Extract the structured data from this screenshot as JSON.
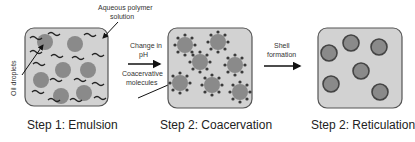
{
  "diagram": {
    "panels": [
      {
        "id": "emulsion",
        "caption": "Step 1: Emulsion"
      },
      {
        "id": "coacervation",
        "caption": "Step 2: Coacervation"
      },
      {
        "id": "reticulation",
        "caption": "Step 2: Reticulation"
      }
    ],
    "labels": {
      "aqueous_line1": "Aqueous polymer",
      "aqueous_line2": "solution",
      "oil_droplets": "Oil droplets",
      "change_line1": "Change in",
      "change_line2": "pH",
      "coacervative_line1": "Coacervative",
      "coacervative_line2": "molecules",
      "shell_line1": "Shell",
      "shell_line2": "formation"
    },
    "colors": {
      "panel_fill": "#d2d2d2",
      "panel_stroke": "#555555",
      "droplet": "#8a8a8a",
      "droplet_stroke": "#444444",
      "dots": "#3a3a3a",
      "arrow": "#111111"
    }
  }
}
